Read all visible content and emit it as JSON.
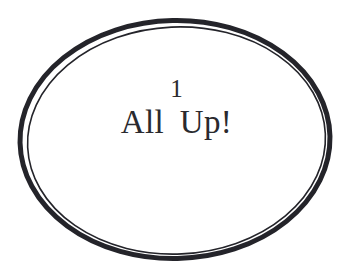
{
  "canvas": {
    "width": 353,
    "height": 278,
    "background_color": "#ffffff"
  },
  "badge": {
    "shape_name": "double-ellipse-outline",
    "stroke_color": "#24242a",
    "fill_color": "#ffffff",
    "outer_stroke_width": 5,
    "inner_stroke_width": 1.6,
    "outer_ellipse": {
      "cx": 175,
      "cy": 139.5,
      "rx": 155,
      "ry": 119,
      "rotation_deg": -1.2
    },
    "inner_ellipse": {
      "cx": 176.5,
      "cy": 140.5,
      "rx": 149,
      "ry": 113.5,
      "rotation_deg": -2.6
    }
  },
  "label": {
    "line_top": "1",
    "line_main": "All Up!",
    "text_color": "#2a2a2e"
  }
}
